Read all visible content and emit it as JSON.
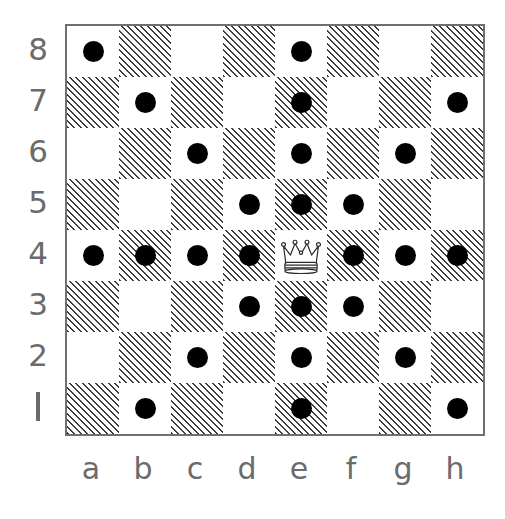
{
  "figure": {
    "kind": "chess-diagram",
    "background_color": "#ffffff",
    "label_color": "#6b6b6b",
    "border_color": "#6f6f6f",
    "dot_color": "#000000",
    "dark_square_hatch_color": "#3d3d3d",
    "light_square_color": "#ffffff"
  },
  "board": {
    "files": [
      "a",
      "b",
      "c",
      "d",
      "e",
      "f",
      "g",
      "h"
    ],
    "ranks": [
      "8",
      "7",
      "6",
      "5",
      "4",
      "3",
      "2",
      "1"
    ],
    "rank_one_glyph": "1",
    "size": 8
  },
  "pieces": [
    {
      "type": "queen",
      "color": "white",
      "square": "e4",
      "icon": "crown-icon",
      "label": "Queen"
    }
  ],
  "move_markers": {
    "marker_style": "filled-dot",
    "count": 27,
    "squares": [
      "a8",
      "e8",
      "b7",
      "e7",
      "h7",
      "c6",
      "e6",
      "g6",
      "d5",
      "e5",
      "f5",
      "a4",
      "b4",
      "c4",
      "d4",
      "f4",
      "g4",
      "h4",
      "d3",
      "e3",
      "f3",
      "c2",
      "e2",
      "g2",
      "b1",
      "e1",
      "h1"
    ]
  },
  "chart_data": {
    "type": "heatmap",
    "xlabel": "",
    "ylabel": "",
    "categories": [
      "a",
      "b",
      "c",
      "d",
      "e",
      "f",
      "g",
      "h"
    ],
    "rows": [
      "8",
      "7",
      "6",
      "5",
      "4",
      "3",
      "2",
      "1"
    ],
    "legend": [
      "dot = reachable square",
      "crown = queen on e4"
    ],
    "grid": true,
    "values": [
      [
        1,
        0,
        0,
        0,
        1,
        0,
        0,
        0
      ],
      [
        0,
        1,
        0,
        0,
        1,
        0,
        0,
        1
      ],
      [
        0,
        0,
        1,
        0,
        1,
        0,
        1,
        0
      ],
      [
        0,
        0,
        0,
        1,
        1,
        1,
        0,
        0
      ],
      [
        1,
        1,
        1,
        1,
        2,
        1,
        1,
        1
      ],
      [
        0,
        0,
        0,
        1,
        1,
        1,
        0,
        0
      ],
      [
        0,
        0,
        1,
        0,
        1,
        0,
        1,
        0
      ],
      [
        0,
        1,
        0,
        0,
        1,
        0,
        0,
        1
      ]
    ],
    "value_key": {
      "0": "empty",
      "1": "reachable",
      "2": "queen"
    }
  }
}
